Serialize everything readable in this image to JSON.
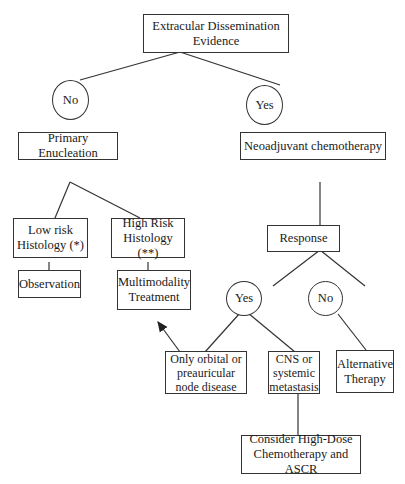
{
  "nodes": {
    "root": "Extracular Dissemination Evidence",
    "no1": "No",
    "yes1": "Yes",
    "primary_enucleation": "Primary Enucleation",
    "neoadjuvant": "Neoadjuvant chemotherapy",
    "low_risk": "Low risk Histology (*)",
    "high_risk": "High Risk Histology (**)",
    "observation": "Observation",
    "multimodality": "Multimodality Treatment",
    "response": "Response",
    "yes2": "Yes",
    "no2": "No",
    "orbital": "Only orbital or preauricular node disease",
    "cns": "CNS or systemic metastasis",
    "alternative": "Alternative Therapy",
    "high_dose": "Consider High-Dose Chemotherapy and ASCR"
  },
  "colors": {
    "line": "#333333",
    "background": "#ffffff",
    "text": "#1a1a1a"
  }
}
